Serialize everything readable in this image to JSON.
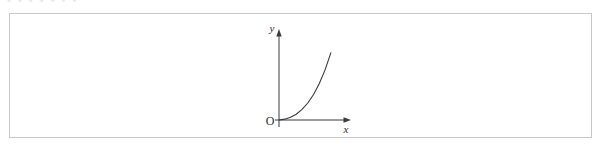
{
  "page": {
    "background_color": "#ffffff",
    "top_clipped_text": "• •  • • •   • •"
  },
  "figure": {
    "frame": {
      "border_color": "#c9c9cc",
      "fill_color": "#ffffff"
    },
    "stroke_color": "#3a3a3a"
  },
  "chart_data": {
    "type": "line",
    "title": "",
    "subtitle": "",
    "xlabel": "x",
    "ylabel": "y",
    "origin_label": "O",
    "grid": false,
    "legend": [],
    "legend_position": "none",
    "axis_style": "arrow-tipped quadrant-one axes",
    "xlim": [
      0,
      5
    ],
    "ylim": [
      0,
      5
    ],
    "x_tick_labels": [],
    "y_tick_labels": [],
    "annotations": [],
    "series": [
      {
        "name": "curve",
        "description": "increasing convex curve through the origin",
        "x": [
          0.0,
          0.4,
          0.8,
          1.2,
          1.6,
          2.0,
          2.4,
          2.8,
          3.2,
          3.6
        ],
        "y": [
          0.0,
          0.05,
          0.16,
          0.34,
          0.62,
          1.0,
          1.5,
          2.15,
          2.95,
          3.95
        ]
      }
    ]
  }
}
